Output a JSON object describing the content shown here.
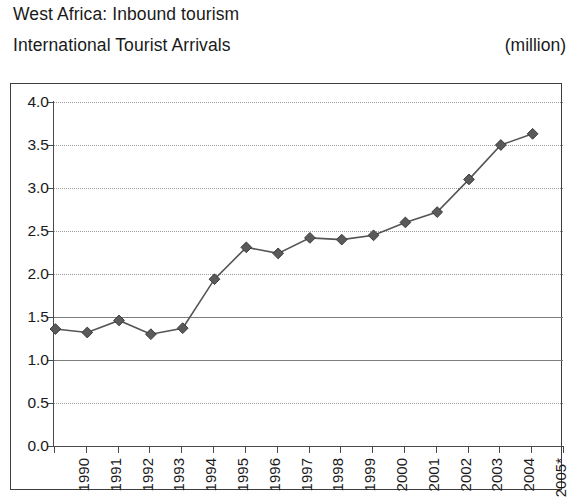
{
  "heading": {
    "line1": "West Africa: Inbound tourism",
    "line2": "International Tourist Arrivals",
    "unit": "(million)"
  },
  "chart_data": {
    "type": "line",
    "title": "West Africa: Inbound tourism",
    "subtitle": "International Tourist Arrivals",
    "xlabel": "",
    "ylabel": "",
    "unit": "million",
    "ylim": [
      0.0,
      4.0
    ],
    "ytick_step": 0.5,
    "grid": true,
    "legend": "none",
    "marker": "diamond",
    "line_color": "#555555",
    "marker_color": "#5a5a5a",
    "categories": [
      "1990",
      "1991",
      "1992",
      "1993",
      "1994",
      "1995",
      "1996",
      "1997",
      "1998",
      "1999",
      "2000",
      "2001",
      "2002",
      "2003",
      "2004",
      "2005*"
    ],
    "values": [
      1.36,
      1.32,
      1.46,
      1.3,
      1.37,
      1.94,
      2.31,
      2.24,
      2.42,
      2.4,
      2.45,
      2.6,
      2.72,
      3.1,
      3.5,
      3.63
    ],
    "ytick_labels": [
      "4.0",
      "3.5",
      "3.0",
      "2.5",
      "2.0",
      "1.5",
      "1.0",
      "0.5",
      "0.0"
    ],
    "ytick_values": [
      4.0,
      3.5,
      3.0,
      2.5,
      2.0,
      1.5,
      1.0,
      0.5,
      0.0
    ],
    "footnote_marker": "*"
  }
}
